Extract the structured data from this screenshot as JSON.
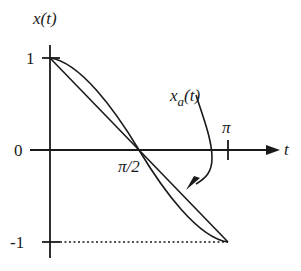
{
  "figure": {
    "y_axis_label": "x(t)",
    "x_axis_label": "t",
    "y_ticks": [
      "1",
      "0",
      "-1"
    ],
    "x_ticks": [
      "π/2",
      "π"
    ],
    "curve_annotation": {
      "main": "x",
      "subscript": "a",
      "suffix": "(t)"
    },
    "curves": [
      {
        "name": "x(t)",
        "description": "cosine curve cos(t) from (0,1) to (π,-1)"
      },
      {
        "name": "x_a(t)",
        "description": "straight-line approximation from (0,1) to (π,-1)"
      }
    ],
    "reference_line": "dotted horizontal line at -1 from 0 to π",
    "line_color": "#1a1a1a"
  }
}
